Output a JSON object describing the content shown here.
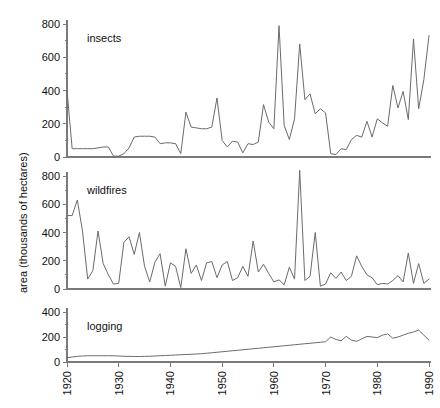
{
  "figure": {
    "ylabel": "area (thousands of hectares)",
    "background": "#ffffff",
    "line_color": "#6b6b6b",
    "axis_color": "#7a7a7a"
  },
  "chart_data": [
    {
      "type": "line",
      "title": "",
      "panel_label": "insects",
      "xlabel": "",
      "ylabel": "area (thousands of hectares)",
      "xlim": [
        1920,
        1990
      ],
      "ylim": [
        0,
        850
      ],
      "yticks": [
        0,
        200,
        400,
        600,
        800
      ],
      "ytick_labels": [
        "0",
        "200",
        "400",
        "600",
        "800"
      ],
      "xticks": [
        1920,
        1930,
        1940,
        1950,
        1960,
        1970,
        1980,
        1990
      ],
      "xtick_labels": [
        "1920",
        "1930",
        "1940",
        "1950",
        "1960",
        "1970",
        "1980",
        "1990"
      ],
      "grid": false,
      "legend": "none",
      "series": [
        {
          "name": "insects",
          "x": [
            1920,
            1921,
            1922,
            1923,
            1924,
            1925,
            1926,
            1927,
            1928,
            1929,
            1930,
            1931,
            1932,
            1933,
            1934,
            1935,
            1936,
            1937,
            1938,
            1939,
            1940,
            1941,
            1942,
            1943,
            1944,
            1945,
            1946,
            1947,
            1948,
            1949,
            1950,
            1951,
            1952,
            1953,
            1954,
            1955,
            1956,
            1957,
            1958,
            1959,
            1960,
            1961,
            1962,
            1963,
            1964,
            1965,
            1966,
            1967,
            1968,
            1969,
            1970,
            1971,
            1972,
            1973,
            1974,
            1975,
            1976,
            1977,
            1978,
            1979,
            1980,
            1981,
            1982,
            1983,
            1984,
            1985,
            1986,
            1987,
            1988,
            1989,
            1990
          ],
          "values": [
            400,
            50,
            50,
            50,
            50,
            50,
            55,
            60,
            60,
            5,
            5,
            20,
            55,
            120,
            125,
            125,
            125,
            120,
            80,
            85,
            85,
            80,
            20,
            270,
            180,
            175,
            170,
            170,
            180,
            355,
            100,
            60,
            95,
            90,
            25,
            80,
            75,
            90,
            315,
            210,
            170,
            790,
            190,
            105,
            230,
            680,
            345,
            380,
            260,
            290,
            265,
            20,
            15,
            50,
            45,
            105,
            130,
            120,
            215,
            120,
            230,
            205,
            185,
            430,
            295,
            395,
            225,
            710,
            290,
            465,
            730
          ]
        }
      ]
    },
    {
      "type": "line",
      "title": "",
      "panel_label": "wildfires",
      "xlabel": "",
      "ylabel": "area (thousands of hectares)",
      "xlim": [
        1920,
        1990
      ],
      "ylim": [
        0,
        850
      ],
      "yticks": [
        0,
        200,
        400,
        600,
        800
      ],
      "ytick_labels": [
        "0",
        "200",
        "400",
        "600",
        "800"
      ],
      "xticks": [
        1920,
        1930,
        1940,
        1950,
        1960,
        1970,
        1980,
        1990
      ],
      "xtick_labels": [
        "1920",
        "1930",
        "1940",
        "1950",
        "1960",
        "1970",
        "1980",
        "1990"
      ],
      "grid": false,
      "legend": "none",
      "series": [
        {
          "name": "wildfires",
          "x": [
            1920,
            1921,
            1922,
            1923,
            1924,
            1925,
            1926,
            1927,
            1928,
            1929,
            1930,
            1931,
            1932,
            1933,
            1934,
            1935,
            1936,
            1937,
            1938,
            1939,
            1940,
            1941,
            1942,
            1943,
            1944,
            1945,
            1946,
            1947,
            1948,
            1949,
            1950,
            1951,
            1952,
            1953,
            1954,
            1955,
            1956,
            1957,
            1958,
            1959,
            1960,
            1961,
            1962,
            1963,
            1964,
            1965,
            1966,
            1967,
            1968,
            1969,
            1970,
            1971,
            1972,
            1973,
            1974,
            1975,
            1976,
            1977,
            1978,
            1979,
            1980,
            1981,
            1982,
            1983,
            1984,
            1985,
            1986,
            1987,
            1988,
            1989,
            1990
          ],
          "values": [
            520,
            520,
            630,
            410,
            70,
            130,
            410,
            180,
            100,
            35,
            40,
            330,
            370,
            245,
            400,
            160,
            50,
            190,
            250,
            20,
            185,
            160,
            10,
            285,
            110,
            170,
            60,
            185,
            195,
            80,
            170,
            195,
            60,
            80,
            160,
            90,
            340,
            120,
            175,
            110,
            50,
            65,
            30,
            155,
            70,
            840,
            60,
            90,
            400,
            20,
            35,
            115,
            75,
            120,
            60,
            90,
            235,
            160,
            100,
            80,
            30,
            40,
            35,
            60,
            95,
            50,
            255,
            40,
            180,
            40,
            70
          ]
        }
      ]
    },
    {
      "type": "line",
      "title": "",
      "panel_label": "logging",
      "xlabel": "",
      "ylabel": "area (thousands of hectares)",
      "xlim": [
        1920,
        1990
      ],
      "ylim": [
        0,
        430
      ],
      "yticks": [
        0,
        200,
        400
      ],
      "ytick_labels": [
        "0",
        "200",
        "400"
      ],
      "xticks": [
        1920,
        1930,
        1940,
        1950,
        1960,
        1970,
        1980,
        1990
      ],
      "xtick_labels": [
        "1920",
        "1930",
        "1940",
        "1950",
        "1960",
        "1970",
        "1980",
        "1990"
      ],
      "grid": false,
      "legend": "none",
      "series": [
        {
          "name": "logging",
          "x": [
            1920,
            1921,
            1922,
            1923,
            1924,
            1925,
            1926,
            1927,
            1928,
            1929,
            1930,
            1931,
            1932,
            1933,
            1934,
            1935,
            1936,
            1937,
            1938,
            1939,
            1940,
            1941,
            1942,
            1943,
            1944,
            1945,
            1946,
            1947,
            1948,
            1949,
            1950,
            1951,
            1952,
            1953,
            1954,
            1955,
            1956,
            1957,
            1958,
            1959,
            1960,
            1961,
            1962,
            1963,
            1964,
            1965,
            1966,
            1967,
            1968,
            1969,
            1970,
            1971,
            1972,
            1973,
            1974,
            1975,
            1976,
            1977,
            1978,
            1979,
            1980,
            1981,
            1982,
            1983,
            1984,
            1985,
            1986,
            1987,
            1988,
            1989,
            1990
          ],
          "values": [
            35,
            40,
            45,
            48,
            50,
            50,
            50,
            50,
            50,
            50,
            48,
            46,
            45,
            44,
            44,
            45,
            46,
            48,
            50,
            52,
            54,
            56,
            58,
            60,
            62,
            64,
            66,
            70,
            74,
            78,
            82,
            86,
            90,
            94,
            98,
            102,
            106,
            110,
            114,
            118,
            122,
            126,
            130,
            134,
            138,
            142,
            146,
            150,
            154,
            158,
            162,
            200,
            180,
            170,
            205,
            175,
            165,
            185,
            205,
            200,
            195,
            215,
            225,
            190,
            200,
            215,
            230,
            240,
            255,
            215,
            175
          ]
        }
      ]
    }
  ]
}
